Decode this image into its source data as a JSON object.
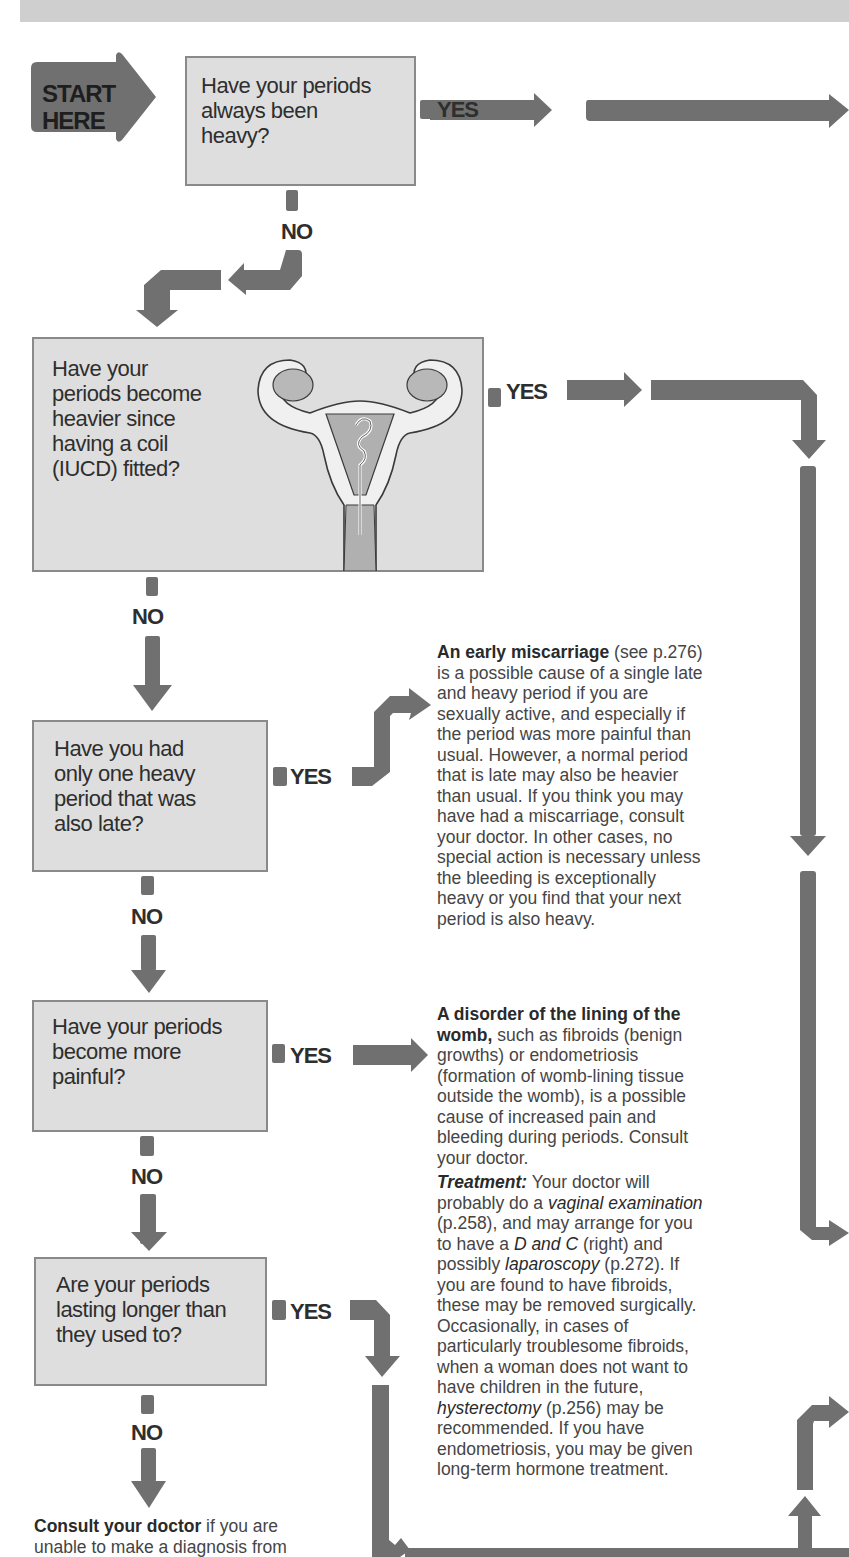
{
  "header": {
    "band_color": "#cfcfcf"
  },
  "start": {
    "line1": "START",
    "line2": "HERE"
  },
  "colors": {
    "arrow": "#707070",
    "box_fill": "#dedede",
    "box_border": "#8a8a8a",
    "text": "#2e2e2e"
  },
  "questions": [
    {
      "id": "q1",
      "lines": [
        "Have your periods",
        "always been",
        "heavy?"
      ],
      "yes": "YES",
      "no": "NO"
    },
    {
      "id": "q2",
      "lines": [
        "Have your",
        "periods become",
        "heavier since",
        "having a coil",
        "(IUCD) fitted?"
      ],
      "yes": "YES",
      "no": "NO",
      "illustration": "uterus-with-coil"
    },
    {
      "id": "q3",
      "lines": [
        "Have you had",
        "only one heavy",
        "period that was",
        "also late?"
      ],
      "yes": "YES",
      "no": "NO"
    },
    {
      "id": "q4",
      "lines": [
        "Have your periods",
        "become more",
        "painful?"
      ],
      "yes": "YES",
      "no": "NO"
    },
    {
      "id": "q5",
      "lines": [
        "Are your periods",
        "lasting longer than",
        "they used to?"
      ],
      "yes": "YES",
      "no": "NO"
    }
  ],
  "answers": {
    "miscarriage": {
      "title": "An early miscarriage",
      "ref": " (see p.276)",
      "lines": [
        "is a possible cause of a single late",
        "and heavy period if you are",
        "sexually active, and especially if",
        "the period was more painful than",
        "usual. However, a normal period",
        "that is late may also be heavier",
        "than usual. If you think you may",
        "have had a miscarriage, consult",
        "your doctor. In other cases, no",
        "special action is necessary unless",
        "the bleeding is exceptionally",
        "heavy or you find that your next",
        "period is also heavy."
      ]
    },
    "womb_disorder": {
      "title_line1": "A disorder of the lining of the",
      "title_line2": "womb,",
      "line2_rest": " such as fibroids (benign",
      "lines": [
        "growths) or endometriosis",
        "(formation of womb-lining tissue",
        "outside the womb), is a possible",
        "cause of increased pain and",
        "bleeding during periods. Consult",
        "your doctor."
      ],
      "treatment_label": "Treatment:",
      "treatment_l1": " Your doctor will",
      "t2a": "probably do a ",
      "t2b": "vaginal examination",
      "t3": "(p.258), and may arrange for you",
      "t4a": "to have a ",
      "t4b": "D and C",
      "t4c": " (right) and",
      "t5a": "possibly ",
      "t5b": "laparoscopy",
      "t5c": " (p.272). If",
      "t_lines": [
        "you are found to have fibroids,",
        "these may be removed surgically.",
        "Occasionally, in cases of",
        "particularly troublesome fibroids,",
        "when a woman does not want to",
        "have children in the future,"
      ],
      "t12a": "hysterectomy",
      "t12b": " (p.256) may be",
      "t_end": [
        "recommended. If you have",
        "endometriosis, you may be given",
        "long-term hormone treatment."
      ]
    },
    "consult": {
      "title": "Consult your doctor",
      "rest": " if you are",
      "line2": "unable to make a diagnosis from"
    }
  }
}
